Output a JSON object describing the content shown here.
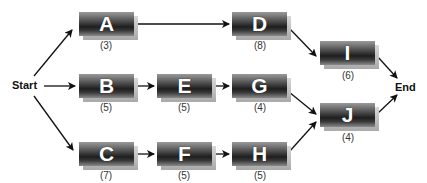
{
  "diagram": {
    "type": "activity-on-node network",
    "start_label": "Start",
    "end_label": "End",
    "nodes": [
      {
        "id": "A",
        "duration": "(3)"
      },
      {
        "id": "B",
        "duration": "(5)"
      },
      {
        "id": "C",
        "duration": "(7)"
      },
      {
        "id": "D",
        "duration": "(8)"
      },
      {
        "id": "E",
        "duration": "(5)"
      },
      {
        "id": "F",
        "duration": "(5)"
      },
      {
        "id": "G",
        "duration": "(4)"
      },
      {
        "id": "H",
        "duration": "(5)"
      },
      {
        "id": "I",
        "duration": "(6)"
      },
      {
        "id": "J",
        "duration": "(4)"
      }
    ],
    "edges": [
      [
        "Start",
        "A"
      ],
      [
        "Start",
        "B"
      ],
      [
        "Start",
        "C"
      ],
      [
        "A",
        "D"
      ],
      [
        "B",
        "E"
      ],
      [
        "E",
        "G"
      ],
      [
        "C",
        "F"
      ],
      [
        "F",
        "H"
      ],
      [
        "D",
        "I"
      ],
      [
        "G",
        "J"
      ],
      [
        "H",
        "J"
      ],
      [
        "I",
        "End"
      ],
      [
        "J",
        "End"
      ]
    ]
  }
}
